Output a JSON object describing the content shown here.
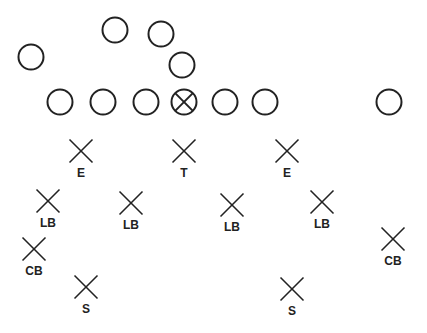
{
  "diagram": {
    "type": "football-formation",
    "colors": {
      "stroke": "#222222",
      "background": "#ffffff"
    },
    "offense": [
      {
        "id": "back-left",
        "x": 31,
        "y": 57,
        "center": false
      },
      {
        "id": "back-top-1",
        "x": 115,
        "y": 30,
        "center": false
      },
      {
        "id": "back-top-2",
        "x": 161,
        "y": 34,
        "center": false
      },
      {
        "id": "quarterback",
        "x": 182,
        "y": 65,
        "center": false
      },
      {
        "id": "line-1",
        "x": 60,
        "y": 102,
        "center": false
      },
      {
        "id": "line-2",
        "x": 103,
        "y": 102,
        "center": false
      },
      {
        "id": "line-3",
        "x": 146,
        "y": 102,
        "center": false
      },
      {
        "id": "line-center",
        "x": 184,
        "y": 102,
        "center": true
      },
      {
        "id": "line-5",
        "x": 225,
        "y": 102,
        "center": false
      },
      {
        "id": "line-6",
        "x": 265,
        "y": 102,
        "center": false
      },
      {
        "id": "wide-receiver",
        "x": 389,
        "y": 102,
        "center": false
      }
    ],
    "defense": [
      {
        "label": "E",
        "x": 81,
        "y": 151
      },
      {
        "label": "T",
        "x": 184,
        "y": 151
      },
      {
        "label": "E",
        "x": 287,
        "y": 151
      },
      {
        "label": "LB",
        "x": 48,
        "y": 201
      },
      {
        "label": "LB",
        "x": 131,
        "y": 203
      },
      {
        "label": "LB",
        "x": 232,
        "y": 205
      },
      {
        "label": "LB",
        "x": 322,
        "y": 202
      },
      {
        "label": "CB",
        "x": 34,
        "y": 249
      },
      {
        "label": "CB",
        "x": 393,
        "y": 239
      },
      {
        "label": "S",
        "x": 86,
        "y": 287
      },
      {
        "label": "S",
        "x": 292,
        "y": 289
      }
    ]
  }
}
